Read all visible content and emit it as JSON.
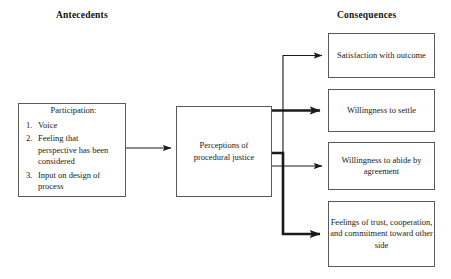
{
  "headers": {
    "left": "Antecedents",
    "right": "Consequences"
  },
  "nodes": {
    "participation": {
      "title": "Participation:",
      "items": [
        {
          "num": "1.",
          "text": "Voice"
        },
        {
          "num": "2.",
          "text": "Feeling that perspective has been considered"
        },
        {
          "num": "3.",
          "text": "Input on design of process"
        }
      ]
    },
    "perceptions": {
      "label": "Perceptions of procedural justice"
    },
    "consequences": [
      {
        "id": "satisfaction",
        "label": "Satisfaction with outcome"
      },
      {
        "id": "settle",
        "label": "Willingness to settle"
      },
      {
        "id": "abide",
        "label": "Willingness to abide by agreement"
      },
      {
        "id": "trust",
        "label": "Feelings of trust, cooperation, and commitment toward other side"
      }
    ]
  },
  "connectors": [
    {
      "id": "participation-to-perceptions",
      "weight": "thin"
    },
    {
      "id": "perceptions-to-satisfaction",
      "weight": "thin"
    },
    {
      "id": "perceptions-to-settle",
      "weight": "bold"
    },
    {
      "id": "perceptions-to-abide",
      "weight": "thin"
    },
    {
      "id": "perceptions-to-trust",
      "weight": "bold"
    }
  ],
  "colors": {
    "background": "#ffffff",
    "box_border": "#5a5a5a",
    "text": "#1a1a1a",
    "connector": "#1a1a1a"
  }
}
